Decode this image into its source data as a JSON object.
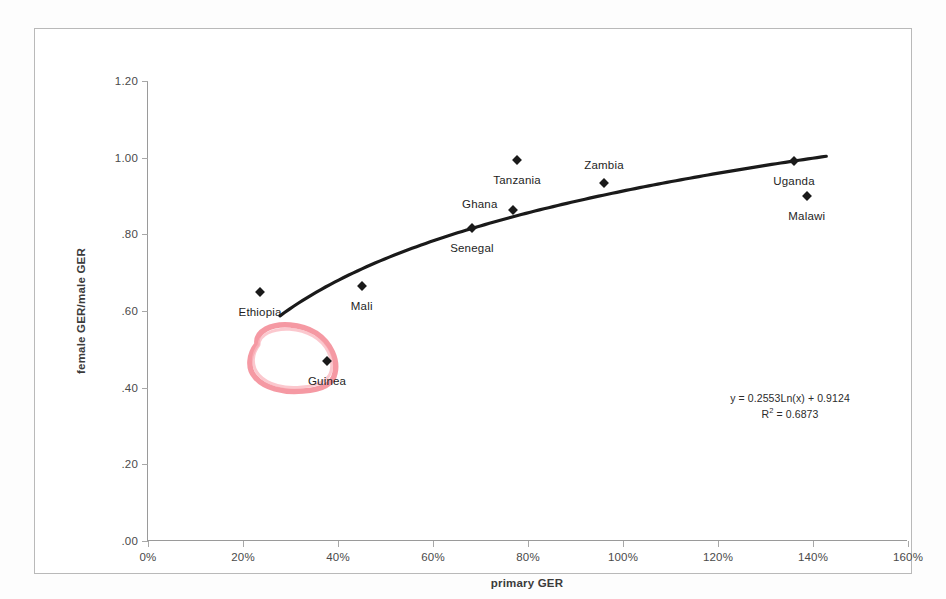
{
  "chart_data": {
    "type": "scatter",
    "title": "",
    "xlabel": "primary GER",
    "ylabel": "female GER/male GER",
    "xlim": [
      0,
      160
    ],
    "ylim": [
      0.0,
      1.2
    ],
    "x_tick_labels": [
      "0%",
      "20%",
      "40%",
      "60%",
      "80%",
      "100%",
      "120%",
      "140%",
      "160%"
    ],
    "x_ticks": [
      0,
      20,
      40,
      60,
      80,
      100,
      120,
      140,
      160
    ],
    "y_tick_labels": [
      "1.20",
      "1.00",
      ".80",
      ".60",
      ".40",
      ".20",
      ".00"
    ],
    "y_ticks": [
      1.2,
      1.0,
      0.8,
      0.6,
      0.4,
      0.2,
      0.0
    ],
    "grid": false,
    "legend": "none",
    "points": [
      {
        "label": "Ethiopia",
        "x": 23.6,
        "y": 0.65,
        "label_dx": 0,
        "label_dy": 14
      },
      {
        "label": "Mali",
        "x": 45.0,
        "y": 0.665,
        "label_dx": 0,
        "label_dy": 14
      },
      {
        "label": "Guinea",
        "x": 37.7,
        "y": 0.47,
        "label_dx": 0,
        "label_dy": 14
      },
      {
        "label": "Senegal",
        "x": 68.2,
        "y": 0.816,
        "label_dx": 0,
        "label_dy": 14
      },
      {
        "label": "Ghana",
        "x": 76.8,
        "y": 0.863,
        "label_dx": -33,
        "label_dy": -12
      },
      {
        "label": "Tanzania",
        "x": 77.7,
        "y": 0.993,
        "label_dx": 0,
        "label_dy": 14
      },
      {
        "label": "Zambia",
        "x": 96.0,
        "y": 0.934,
        "label_dx": 0,
        "label_dy": -24
      },
      {
        "label": "Uganda",
        "x": 136.0,
        "y": 0.991,
        "label_dx": 0,
        "label_dy": 14
      },
      {
        "label": "Malawi",
        "x": 138.7,
        "y": 0.9,
        "label_dx": 0,
        "label_dy": 14
      }
    ],
    "trendline": {
      "equation": "y = 0.2553Ln(x) + 0.9124",
      "r_squared_label": "R",
      "r_squared_exponent": "2",
      "r_squared_value": "= 0.6873",
      "coefficient": 0.2553,
      "intercept": 0.9124,
      "r_squared": 0.6873,
      "x_start": 28.0,
      "x_end": 143.0,
      "color": "#1a1a1a"
    },
    "annotations": [
      {
        "name": "guinea-highlight-circle",
        "shape": "hand-drawn-ellipse",
        "color": "#f28b96",
        "target": "Guinea"
      }
    ]
  },
  "equation_text": {
    "line1": "y = 0.2553Ln(x) + 0.9124",
    "r_prefix": "R",
    "r_sup": "2",
    "r_suffix": " = 0.6873"
  }
}
